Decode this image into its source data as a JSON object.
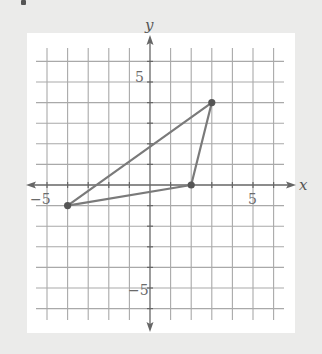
{
  "figure": {
    "axis_labels": {
      "x": "x",
      "y": "y"
    },
    "tick_labels": {
      "x_neg": "−5",
      "x_pos": "5",
      "y_pos": "5",
      "y_neg": "−5"
    },
    "colors": {
      "background": "#ebebea",
      "panel": "#ffffff",
      "grid": "#a9a9a9",
      "axis": "#666666",
      "triangle": "#7a7a7a",
      "vertex": "#555555"
    }
  },
  "chart_data": {
    "type": "scatter",
    "title": "",
    "xlabel": "x",
    "ylabel": "y",
    "xlim": [
      -5.5,
      6.5
    ],
    "ylim": [
      -6.5,
      6.5
    ],
    "grid": true,
    "grid_step": 1,
    "labeled_ticks": {
      "x": [
        -5,
        5
      ],
      "y": [
        5,
        -5
      ]
    },
    "shape": "triangle",
    "vertices": [
      {
        "x": -4,
        "y": -1
      },
      {
        "x": 2,
        "y": 0
      },
      {
        "x": 3,
        "y": 4
      }
    ],
    "edges": [
      [
        [
          -4,
          -1
        ],
        [
          3,
          4
        ]
      ],
      [
        [
          3,
          4
        ],
        [
          2,
          0
        ]
      ],
      [
        [
          2,
          0
        ],
        [
          -4,
          -1
        ]
      ]
    ]
  }
}
